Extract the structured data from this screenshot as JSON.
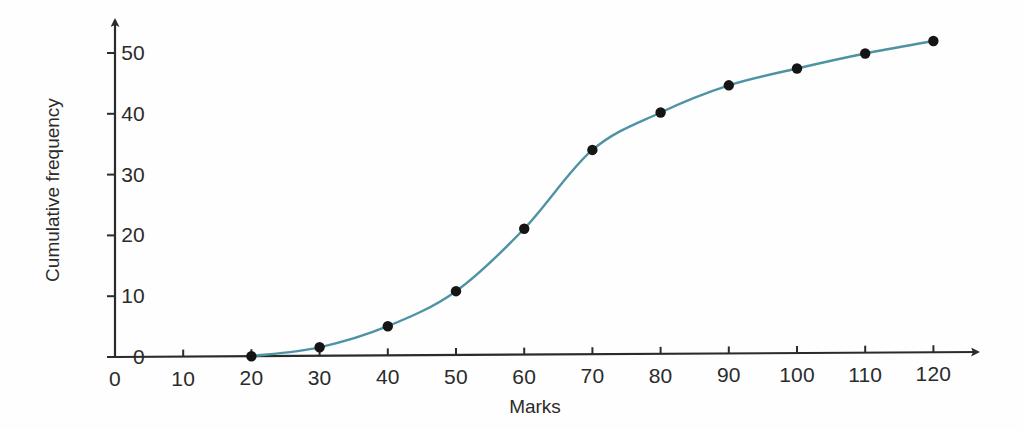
{
  "chart_data": {
    "type": "line",
    "title": "",
    "subtitle": "",
    "xlabel": "Marks",
    "ylabel": "Cumulative frequency",
    "x": [
      20,
      30,
      40,
      50,
      60,
      70,
      80,
      90,
      100,
      110,
      120
    ],
    "values": [
      0,
      1.4,
      4.8,
      10.5,
      20.7,
      33.6,
      39.7,
      44.1,
      46.8,
      49.2,
      51.2
    ],
    "series": [
      {
        "name": "Cumulative frequency",
        "values": [
          0,
          1.4,
          4.8,
          10.5,
          20.7,
          33.6,
          39.7,
          44.1,
          46.8,
          49.2,
          51.2
        ]
      }
    ],
    "xlim": [
      0,
      125
    ],
    "ylim": [
      0,
      54
    ],
    "xticks": [
      0,
      10,
      20,
      30,
      40,
      50,
      60,
      70,
      80,
      90,
      100,
      110,
      120
    ],
    "yticks": [
      0,
      10,
      20,
      30,
      40,
      50
    ],
    "xtick_labels": [
      "0",
      "10",
      "20",
      "30",
      "40",
      "50",
      "60",
      "70",
      "80",
      "90",
      "100",
      "110",
      "120"
    ],
    "ytick_labels": [
      "0",
      "10",
      "20",
      "30",
      "40",
      "50"
    ],
    "grid": false,
    "legend": false,
    "legend_position": "none",
    "marker": "filled-circle",
    "marker_color": "#151515",
    "line_color": "#4e93a4",
    "axis_color": "#2b2b2b",
    "background_color": "#fefefe",
    "annotations": []
  }
}
